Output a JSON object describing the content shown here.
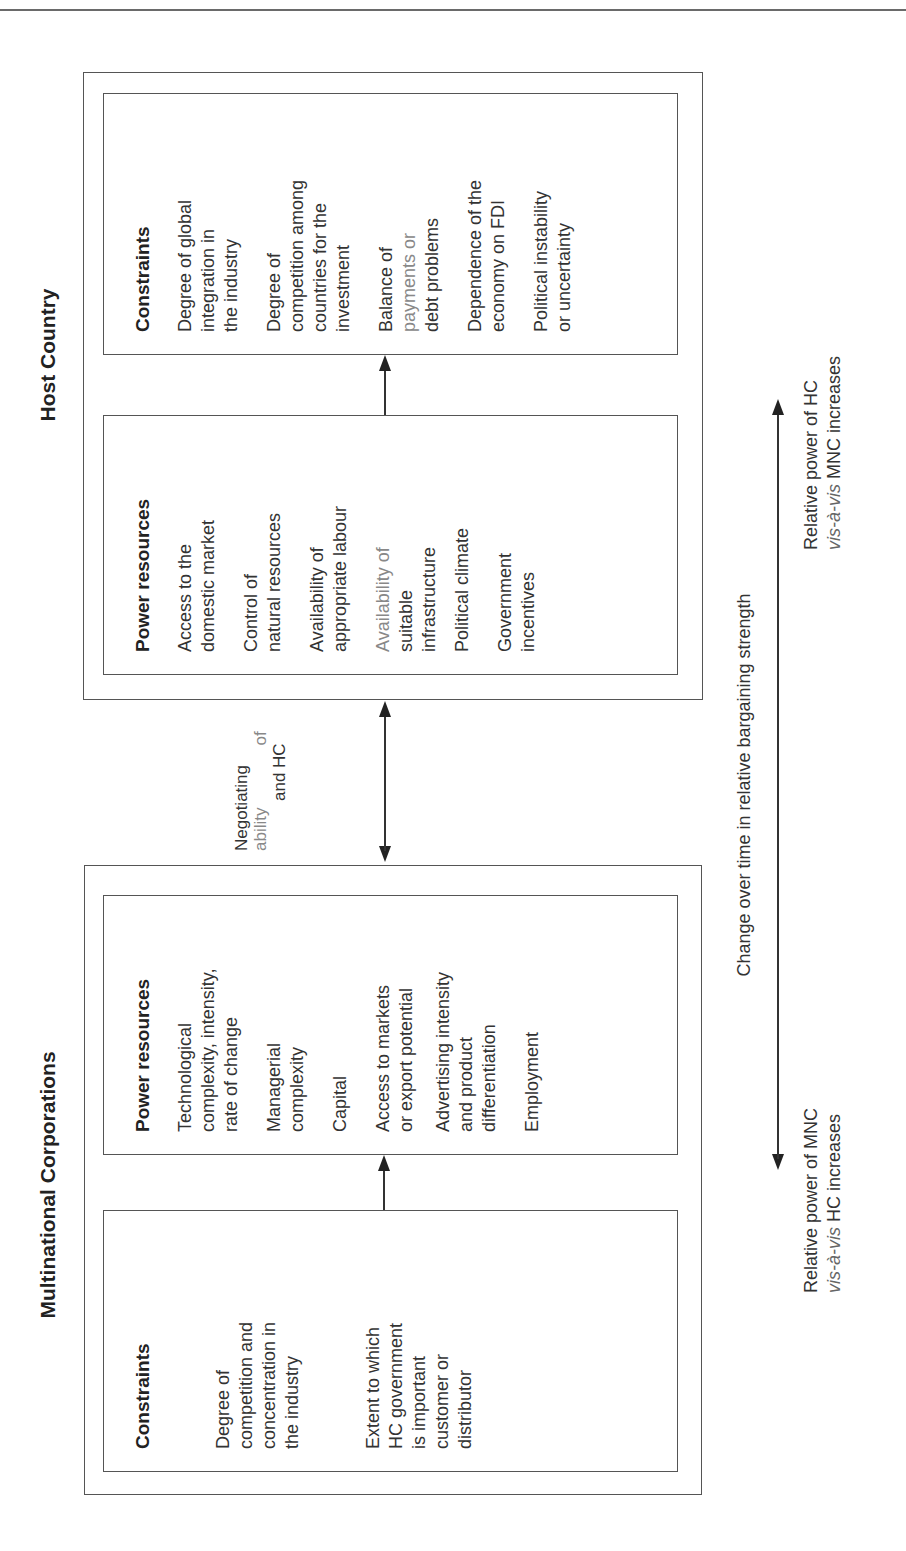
{
  "host_country": {
    "title": "Host Country",
    "constraints": {
      "heading": "Constraints",
      "items": [
        [
          "Degree of global",
          "integration in",
          "the industry"
        ],
        [
          "Degree of",
          "competition among",
          "countries for the",
          "investment"
        ],
        [
          "Balance of",
          "payments or",
          "debt problems"
        ],
        [
          "Dependence of the",
          "economy on FDI"
        ],
        [
          "Political instability",
          "or uncertainty"
        ]
      ]
    },
    "power_resources": {
      "heading": "Power resources",
      "items": [
        [
          "Access to the",
          "domestic market"
        ],
        [
          "Control of",
          "natural resources"
        ],
        [
          "Availability of",
          "appropriate labour"
        ],
        [
          "Availability of",
          "suitable",
          "infrastructure"
        ],
        [
          "Political climate"
        ],
        [
          "Government",
          "incentives"
        ]
      ]
    }
  },
  "negotiation": {
    "line1": "Negotiating",
    "line2_a": "ability",
    "line2_b": "of",
    "line3": "and HC"
  },
  "mnc": {
    "title": "Multinational Corporations",
    "power_resources": {
      "heading": "Power resources",
      "items": [
        [
          "Technological",
          "complexity, intensity,",
          "rate of change"
        ],
        [
          "Managerial",
          "complexity"
        ],
        [
          "Capital"
        ],
        [
          "Access to markets",
          "or export potential"
        ],
        [
          "Advertising intensity",
          "and product",
          "differentiation"
        ],
        [
          "Employment"
        ]
      ]
    },
    "constraints": {
      "heading": "Constraints",
      "items": [
        [
          "Degree of",
          "competition and",
          "concentration in",
          "the industry"
        ],
        [
          "Extent to which",
          "HC government",
          "is important",
          "customer or",
          "distributor"
        ]
      ]
    }
  },
  "bargaining_axis": {
    "label": "Change over time in relative bargaining strength",
    "hc_end": {
      "line1": "Relative power of HC",
      "line2_italic": "vis-à-vis",
      "line2_rest": " MNC increases"
    },
    "mnc_end": {
      "line1": "Relative power of MNC",
      "line2_italic": "vis-à-vis",
      "line2_rest": " HC increases"
    }
  }
}
